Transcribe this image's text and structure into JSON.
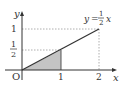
{
  "figure": {
    "function_label": {
      "y": "y",
      "eq": "=",
      "num": "1",
      "den": "2",
      "x": "x"
    },
    "axes": {
      "x_label": "x",
      "y_label": "y",
      "origin_label": "O"
    },
    "x_ticks": [
      "1",
      "2"
    ],
    "y_ticks": {
      "one": "1",
      "half_num": "1",
      "half_den": "2"
    },
    "shaded_region": "triangle under y = 1/2 x from x = 0 to x = 1",
    "colors": {
      "line": "#333333",
      "shade": "#bbbbbb",
      "dashed": "#888888"
    }
  }
}
